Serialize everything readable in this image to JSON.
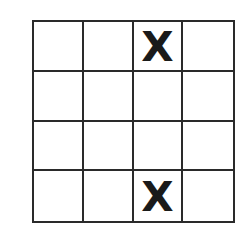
{
  "grid": {
    "rows": 4,
    "cols": 4,
    "line_color": "#2a2a2a",
    "mark_color": "#1a1a1a",
    "cells": [
      [
        "",
        "",
        "X",
        ""
      ],
      [
        "",
        "",
        "",
        ""
      ],
      [
        "",
        "",
        "",
        ""
      ],
      [
        "",
        "",
        "X",
        ""
      ]
    ]
  }
}
